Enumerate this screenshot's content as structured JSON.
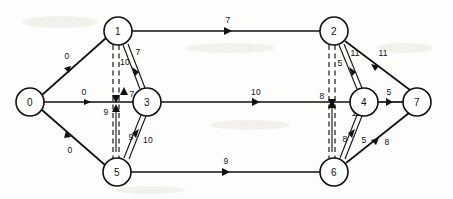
{
  "diagram": {
    "type": "directed-network-flow-graph",
    "canvas": {
      "width": 453,
      "height": 199
    },
    "node_radius": 14,
    "nodes": [
      {
        "id": "0",
        "label": "0",
        "x": 30,
        "y": 102
      },
      {
        "id": "1",
        "label": "1",
        "x": 118,
        "y": 31
      },
      {
        "id": "2",
        "label": "2",
        "x": 334,
        "y": 31
      },
      {
        "id": "3",
        "label": "3",
        "x": 147,
        "y": 102
      },
      {
        "id": "4",
        "label": "4",
        "x": 364,
        "y": 102
      },
      {
        "id": "5",
        "label": "5",
        "x": 117,
        "y": 172
      },
      {
        "id": "6",
        "label": "6",
        "x": 334,
        "y": 172
      },
      {
        "id": "7",
        "label": "7",
        "x": 417,
        "y": 102
      }
    ],
    "edges": [
      {
        "from": "0",
        "to": "1",
        "label": "0",
        "style": "solid",
        "label_dx": -6,
        "label_dy": -8
      },
      {
        "from": "0",
        "to": "3",
        "label": "0",
        "style": "solid",
        "label_dx": 0,
        "label_dy": -8
      },
      {
        "from": "0",
        "to": "5",
        "label": "0",
        "style": "solid",
        "label_dx": -6,
        "label_dy": 9
      },
      {
        "from": "1",
        "to": "2",
        "label": "7",
        "style": "solid",
        "label_dx": 0,
        "label_dy": -8
      },
      {
        "from": "1",
        "to": "3",
        "label": "7",
        "style": "double",
        "label_dx": 9,
        "label_dy": -4
      },
      {
        "from": "1",
        "to": "5",
        "label": "10",
        "style": "dashed",
        "label_dx": -7,
        "label_dy": -6
      },
      {
        "from": "3",
        "to": "1",
        "label": "7",
        "style": "solid",
        "label_dx": 5,
        "label_dy": 0
      },
      {
        "from": "5",
        "to": "1",
        "label": "9",
        "style": "solid",
        "label_dx": -8,
        "label_dy": 0
      },
      {
        "from": "5",
        "to": "3",
        "label": "10",
        "style": "double",
        "label_dx": 10,
        "label_dy": 4
      },
      {
        "from": "5",
        "to": "3",
        "label": "9",
        "style": "solid",
        "label_dx": -2,
        "label_dy": 0
      },
      {
        "from": "3",
        "to": "4",
        "label": "10",
        "style": "solid",
        "label_dx": 0,
        "label_dy": -8
      },
      {
        "from": "5",
        "to": "6",
        "label": "9",
        "style": "solid",
        "label_dx": 0,
        "label_dy": -8
      },
      {
        "from": "2",
        "to": "6",
        "label": "5",
        "style": "dashed",
        "label_dx": -8,
        "label_dy": 0
      },
      {
        "from": "2",
        "to": "7",
        "label": "11",
        "style": "solid",
        "label_dx": 6,
        "label_dy": -4
      },
      {
        "from": "4",
        "to": "2",
        "label": "11",
        "style": "double",
        "label_dx": 8,
        "label_dy": 0
      },
      {
        "from": "4",
        "to": "7",
        "label": "5",
        "style": "solid",
        "label_dx": 0,
        "label_dy": -8
      },
      {
        "from": "6",
        "to": "4",
        "label": "5",
        "style": "double",
        "label_dx": 8,
        "label_dy": 0
      },
      {
        "from": "6",
        "to": "7",
        "label": "8",
        "style": "solid",
        "label_dx": 6,
        "label_dy": -6
      }
    ],
    "annotations": [
      {
        "name": "label-2-4-down",
        "text": "8",
        "x": 324,
        "y": 96
      },
      {
        "name": "label-4-6-down",
        "text": "11",
        "x": 356,
        "y": 113
      },
      {
        "name": "label-6-2-up",
        "text": "8",
        "x": 347,
        "y": 139
      },
      {
        "name": "label-1-3-mid",
        "text": "10",
        "x": 127,
        "y": 62
      },
      {
        "name": "label-3-1-up",
        "text": "7",
        "x": 131,
        "y": 94
      },
      {
        "name": "label-5-1-down",
        "text": "9",
        "x": 112,
        "y": 112
      },
      {
        "name": "label-5-3-mid",
        "text": "9",
        "x": 132,
        "y": 136
      },
      {
        "name": "label-2-4-mid",
        "text": "5",
        "x": 340,
        "y": 63
      }
    ]
  }
}
